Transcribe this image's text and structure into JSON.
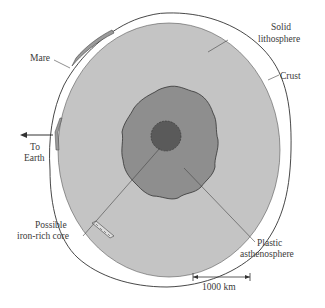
{
  "diagram": {
    "labels": {
      "mare": "Mare",
      "solid_lithosphere_line1": "Solid",
      "solid_lithosphere_line2": "lithosphere",
      "crust": "Crust",
      "to_earth_line1": "To",
      "to_earth_line2": "Earth",
      "core_line1": "Possible",
      "core_line2": "iron-rich core",
      "asthenosphere_line1": "Plastic",
      "asthenosphere_line2": "asthenosphere"
    },
    "scale_bar": {
      "label": "1000 km"
    },
    "colors": {
      "lithosphere": "#c4c4c4",
      "asthenosphere": "#8e8e8e",
      "core": "#5a5a5a",
      "crust": "#ffffff",
      "outline": "#333333"
    }
  }
}
